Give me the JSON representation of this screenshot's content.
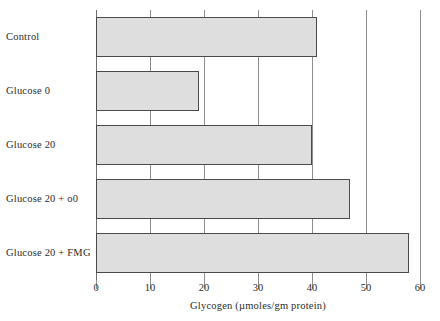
{
  "chart_data": {
    "type": "bar",
    "orientation": "horizontal",
    "title": "",
    "xlabel": "Glycogen (µmoles/gm protein)",
    "ylabel": "",
    "categories": [
      "Control",
      "Glucose 0",
      "Glucose 20",
      "Glucose 20 + o0",
      "Glucose 20 + FMG"
    ],
    "values": [
      41,
      19,
      40,
      47,
      58
    ],
    "xlim": [
      0,
      60
    ],
    "xticks": [
      0,
      10,
      20,
      30,
      40,
      50,
      60
    ],
    "xtick_labels": [
      "0",
      "10",
      "20",
      "30",
      "40",
      "50",
      "60"
    ],
    "grid": true,
    "grid_axis": "x",
    "legend": false,
    "bar_fill_color": "#dedede",
    "bar_edge_color": "#4a4a4a",
    "grid_color": "#8e8e8e",
    "text_color": "#2b2b2b",
    "background_color": "#ffffff"
  }
}
